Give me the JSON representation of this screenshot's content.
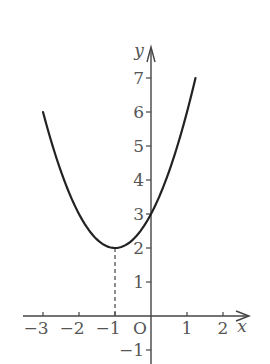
{
  "chart_data": {
    "type": "line",
    "title": "",
    "function": "y = x^2 + 2x + 3 = (x+1)^2 + 2",
    "xlabel": "x",
    "ylabel": "y",
    "origin_label": "O",
    "xlim": [
      -3.4,
      2.8
    ],
    "ylim": [
      -1.4,
      7.8
    ],
    "x_ticks": [
      -3,
      -2,
      -1,
      1,
      2
    ],
    "x_tick_labels": [
      "−3",
      "−2",
      "−1",
      "1",
      "2"
    ],
    "y_ticks": [
      -1,
      1,
      2,
      3,
      4,
      5,
      6,
      7
    ],
    "y_tick_labels": [
      "−1",
      "1",
      "2",
      "3",
      "4",
      "5",
      "6",
      "7"
    ],
    "series": [
      {
        "name": "parabola",
        "x_range": [
          -3,
          1.236
        ],
        "x": [
          -3,
          -2.5,
          -2,
          -1.5,
          -1,
          -0.5,
          0,
          0.5,
          1,
          1.236
        ],
        "y": [
          6,
          4.25,
          3,
          2.25,
          2,
          2.25,
          3,
          4.25,
          6,
          7
        ]
      }
    ],
    "annotations": [
      {
        "type": "vertex",
        "x": -1,
        "y": 2
      },
      {
        "type": "dashed-guide",
        "from": [
          -1,
          2
        ],
        "to": [
          -1,
          0
        ]
      },
      {
        "type": "y-intercept",
        "x": 0,
        "y": 3
      }
    ],
    "grid": false,
    "legend": "none"
  },
  "colors": {
    "curve": "#222222",
    "axes": "#444444",
    "labels": "#555555"
  }
}
